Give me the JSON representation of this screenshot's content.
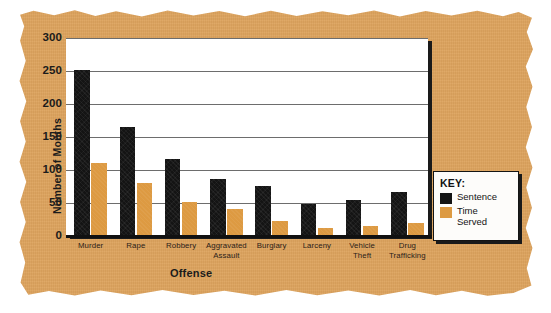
{
  "chart_data": {
    "type": "bar",
    "title": "",
    "xlabel": "Offense",
    "ylabel": "Number of Months",
    "ylim": [
      0,
      300
    ],
    "yticks": [
      0,
      50,
      100,
      150,
      200,
      250,
      300
    ],
    "grid": true,
    "legend_position": "right-outside",
    "categories": [
      "Murder",
      "Rape",
      "Robbery",
      "Aggravated Assault",
      "Burglary",
      "Larceny",
      "Vehicle Theft",
      "Drug Trafficking"
    ],
    "category_lines": [
      [
        "Murder"
      ],
      [
        "Rape"
      ],
      [
        "Robbery"
      ],
      [
        "Aggravated",
        "Assault"
      ],
      [
        "Burglary"
      ],
      [
        "Larceny"
      ],
      [
        "Vehicle",
        "Theft"
      ],
      [
        "Drug",
        "Trafficking"
      ]
    ],
    "series": [
      {
        "name": "Sentence",
        "color": "#141414",
        "values": [
          251,
          165,
          117,
          86,
          76,
          49,
          55,
          66
        ]
      },
      {
        "name": "Time Served",
        "color": "#dd9a42",
        "values": [
          110,
          80,
          52,
          41,
          22,
          12,
          15,
          20
        ]
      }
    ]
  },
  "legend": {
    "title": "KEY:",
    "entries": [
      {
        "label": "Sentence",
        "swatch": "black-swatch"
      },
      {
        "label": "Time\nServed",
        "swatch": "orange-swatch"
      }
    ]
  },
  "colors": {
    "background_paper": "#dda35d",
    "plot_background": "#ffffff",
    "sentence_bar": "#141414",
    "time_served_bar": "#dd9a42",
    "gridline": "#6d6d6d",
    "axis": "#111111",
    "text": "#1b1b1b"
  }
}
